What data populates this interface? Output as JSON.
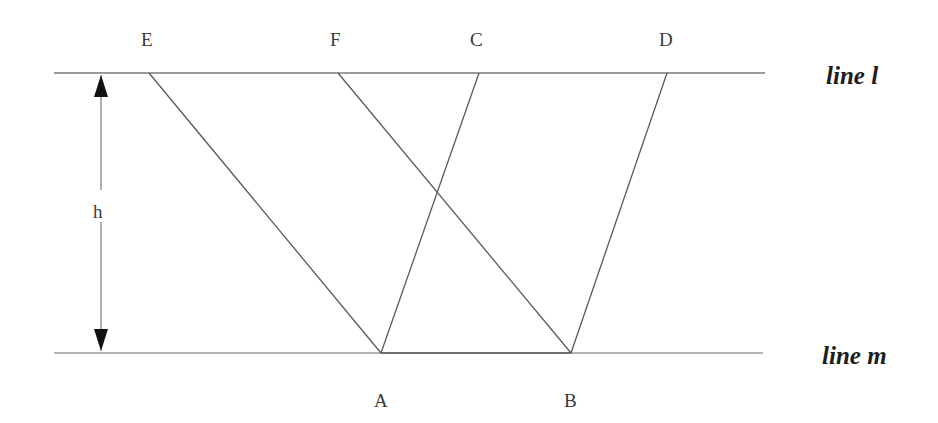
{
  "figure": {
    "type": "geometry-diagram",
    "background_color": "#ffffff",
    "stroke_color": "#5a5a5a",
    "label_color": "#3a3a3a",
    "line_name_color": "#1d1d1d"
  },
  "parallel_lines": [
    {
      "id": "line-l",
      "label": "line l",
      "y": 73,
      "x_start": 54,
      "x_end": 765,
      "label_x": 826,
      "label_y": 62
    },
    {
      "id": "line-m",
      "label": "line m",
      "y": 353,
      "x_start": 54,
      "x_end": 763,
      "label_x": 822,
      "label_y": 342
    }
  ],
  "points": [
    {
      "id": "E",
      "label": "E",
      "x": 149,
      "y": 73,
      "label_x": 141,
      "label_y": 29,
      "on": "line l"
    },
    {
      "id": "F",
      "label": "F",
      "x": 338,
      "y": 73,
      "label_x": 330,
      "label_y": 29,
      "on": "line l"
    },
    {
      "id": "C",
      "label": "C",
      "x": 479,
      "y": 73,
      "label_x": 470,
      "label_y": 29,
      "on": "line l"
    },
    {
      "id": "D",
      "label": "D",
      "x": 667,
      "y": 73,
      "label_x": 659,
      "label_y": 29,
      "on": "line l"
    },
    {
      "id": "A",
      "label": "A",
      "x": 381,
      "y": 353,
      "label_x": 374,
      "label_y": 390,
      "on": "line m"
    },
    {
      "id": "B",
      "label": "B",
      "x": 571,
      "y": 353,
      "label_x": 564,
      "label_y": 390,
      "on": "line m"
    }
  ],
  "segments": [
    {
      "id": "seg-EA",
      "from": "E",
      "to": "A",
      "x1": 149,
      "y1": 73,
      "x2": 381,
      "y2": 353
    },
    {
      "id": "seg-FB",
      "from": "F",
      "to": "B",
      "x1": 338,
      "y1": 73,
      "x2": 571,
      "y2": 353
    },
    {
      "id": "seg-CA",
      "from": "C",
      "to": "A",
      "x1": 479,
      "y1": 73,
      "x2": 381,
      "y2": 353
    },
    {
      "id": "seg-DB",
      "from": "D",
      "to": "B",
      "x1": 667,
      "y1": 73,
      "x2": 571,
      "y2": 353
    },
    {
      "id": "seg-AB",
      "from": "A",
      "to": "B",
      "x1": 381,
      "y1": 353,
      "x2": 571,
      "y2": 353
    }
  ],
  "intersection": {
    "id": "cross-FB-CA",
    "x": 438,
    "y": 199
  },
  "height_measure": {
    "label": "h",
    "label_x": 93,
    "label_y": 201,
    "axis_x": 101,
    "top_y": 75,
    "bottom_y": 351,
    "gap_top": 190,
    "gap_bottom": 222,
    "arrow_half_width": 7,
    "arrow_length": 22
  }
}
